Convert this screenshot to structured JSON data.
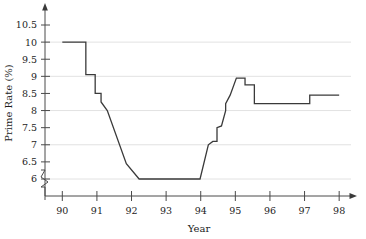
{
  "chart_data": {
    "type": "line",
    "title": "",
    "xlabel": "Year",
    "ylabel": "Prime Rate (%)",
    "xlim": [
      89.5,
      98.4
    ],
    "ylim": [
      5.6,
      10.8
    ],
    "y_axis_break": true,
    "y_axis_break_note": "axis broken below 6",
    "grid": true,
    "grid_values": [
      6,
      7,
      8,
      9,
      10
    ],
    "legend": "none",
    "xticks": [
      90,
      91,
      92,
      93,
      94,
      95,
      96,
      97,
      98
    ],
    "xtick_labels": [
      "90",
      "91",
      "92",
      "93",
      "94",
      "95",
      "96",
      "97",
      "98"
    ],
    "yticks": [
      6,
      6.5,
      7,
      7.5,
      8,
      8.5,
      9,
      9.5,
      10,
      10.5
    ],
    "ytick_labels": [
      "6",
      "6.5",
      "7",
      "7.5",
      "8",
      "8.5",
      "9",
      "9.5",
      "10",
      "10.5"
    ],
    "line_color": "#3a3a3a",
    "grid_color": "#e2e2e2",
    "axis_color": "#4a4a4a",
    "series": [
      {
        "name": "Prime Rate",
        "x": [
          90.0,
          90.68,
          90.68,
          90.95,
          90.95,
          91.12,
          91.12,
          91.3,
          91.85,
          91.85,
          92.22,
          92.22,
          93.98,
          94.22,
          94.35,
          94.47,
          94.47,
          94.6,
          94.6,
          94.72,
          94.72,
          94.85,
          95.03,
          95.03,
          95.28,
          95.28,
          95.55,
          95.55,
          96.02,
          96.02,
          97.15,
          97.15,
          98.0
        ],
        "y": [
          10.0,
          10.0,
          9.05,
          9.05,
          8.5,
          8.5,
          8.25,
          8.0,
          6.45,
          6.45,
          6.0,
          6.0,
          6.0,
          7.0,
          7.1,
          7.1,
          7.5,
          7.55,
          7.55,
          8.0,
          8.2,
          8.45,
          8.95,
          8.95,
          8.95,
          8.75,
          8.75,
          8.2,
          8.2,
          8.2,
          8.2,
          8.45,
          8.45
        ]
      }
    ],
    "annotations": []
  }
}
